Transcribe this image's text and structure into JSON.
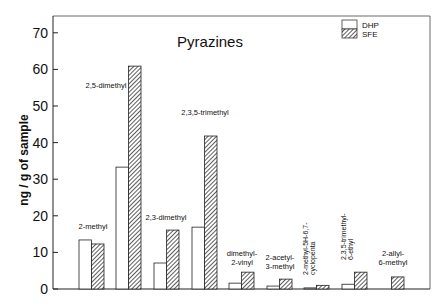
{
  "chart_data": {
    "type": "bar",
    "title": "Pyrazines",
    "xlabel": "",
    "ylabel": "ng / g of sample",
    "ylim": [
      0,
      75
    ],
    "yticks": [
      0,
      10,
      20,
      30,
      40,
      50,
      60,
      70
    ],
    "grid": false,
    "legend_position": "top-right",
    "categories": [
      "2-methyl",
      "2,5-dimethyl",
      "2,3-dimethyl",
      "2,3,5-trimethyl",
      "dimethyl-2-vinyl",
      "2-acetyl-3-methyl",
      "2-methyl-5H-6,7-cyclopenta",
      "2,3,5-trimethyl-6-ethyl",
      "2-allyl-6-methyl"
    ],
    "series": [
      {
        "name": "DHP",
        "pattern": "open",
        "values": [
          13.4,
          33.3,
          7.1,
          16.9,
          1.6,
          0.8,
          0.3,
          1.3,
          0
        ]
      },
      {
        "name": "SFE",
        "pattern": "hatched",
        "values": [
          12.3,
          60.9,
          16.1,
          41.8,
          4.6,
          2.7,
          1.0,
          4.6,
          3.3
        ]
      }
    ]
  }
}
